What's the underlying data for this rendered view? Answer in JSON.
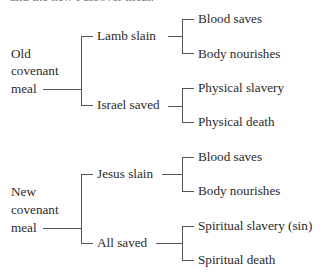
{
  "header_fragment": "and the new Passover meal.",
  "diagram": {
    "old": {
      "root": [
        "Old",
        "covenant",
        "meal"
      ],
      "branches": [
        {
          "label": "Lamb slain",
          "leaves": [
            "Blood saves",
            "Body nourishes"
          ]
        },
        {
          "label": "Israel saved",
          "leaves": [
            "Physical slavery",
            "Physical death"
          ]
        }
      ]
    },
    "new": {
      "root": [
        "New",
        "covenant",
        "meal"
      ],
      "branches": [
        {
          "label": "Jesus slain",
          "leaves": [
            "Blood saves",
            "Body nourishes"
          ]
        },
        {
          "label": "All saved",
          "leaves": [
            "Spiritual slavery (sin)",
            "Spiritual death"
          ]
        }
      ]
    }
  }
}
